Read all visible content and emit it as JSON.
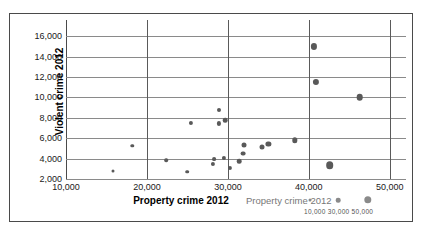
{
  "chart_data": {
    "type": "scatter",
    "title": "",
    "xlabel": "Property crime 2012",
    "ylabel": "Violent crime 2012",
    "xlim": [
      10000,
      52000
    ],
    "ylim": [
      2000,
      17000
    ],
    "xticks": [
      "10,000",
      "20,000",
      "30,000",
      "40,000",
      "50,000"
    ],
    "xtick_values": [
      10000,
      20000,
      30000,
      40000,
      50000
    ],
    "yticks": [
      "2,000",
      "4,000",
      "6,000",
      "8,000",
      "10,000",
      "12,000",
      "14,000",
      "16,000"
    ],
    "ytick_values": [
      2000,
      4000,
      6000,
      8000,
      10000,
      12000,
      14000,
      16000
    ],
    "grid": "both",
    "marker_color": "#595959",
    "size_encoding": "bubble area encodes property crime 2012",
    "points": [
      {
        "x": 15800,
        "y": 2800,
        "size": 3.0
      },
      {
        "x": 18200,
        "y": 5250,
        "size": 3.4
      },
      {
        "x": 22400,
        "y": 3850,
        "size": 3.6
      },
      {
        "x": 25000,
        "y": 2700,
        "size": 3.6
      },
      {
        "x": 25400,
        "y": 7500,
        "size": 4.2
      },
      {
        "x": 28100,
        "y": 3500,
        "size": 4.2
      },
      {
        "x": 28300,
        "y": 3950,
        "size": 3.8
      },
      {
        "x": 28900,
        "y": 8750,
        "size": 4.0
      },
      {
        "x": 28900,
        "y": 7450,
        "size": 4.2
      },
      {
        "x": 29500,
        "y": 4100,
        "size": 4.2
      },
      {
        "x": 29700,
        "y": 7750,
        "size": 4.6
      },
      {
        "x": 30200,
        "y": 3050,
        "size": 4.2
      },
      {
        "x": 31400,
        "y": 3750,
        "size": 4.6
      },
      {
        "x": 31900,
        "y": 4500,
        "size": 4.8
      },
      {
        "x": 32000,
        "y": 5300,
        "size": 5.0
      },
      {
        "x": 34200,
        "y": 5150,
        "size": 5.0
      },
      {
        "x": 35000,
        "y": 5450,
        "size": 5.2
      },
      {
        "x": 38300,
        "y": 5800,
        "size": 5.4
      },
      {
        "x": 40600,
        "y": 15000,
        "size": 6.2
      },
      {
        "x": 40900,
        "y": 11500,
        "size": 6.2
      },
      {
        "x": 42600,
        "y": 3350,
        "size": 7.6
      },
      {
        "x": 46300,
        "y": 10000,
        "size": 6.6
      }
    ]
  },
  "legend": {
    "title": "Property crime 2012",
    "size_labels": "10,000 30,000 50,000",
    "bubbles": [
      {
        "label": "10,000",
        "size": 3.0
      },
      {
        "label": "30,000",
        "size": 4.6
      },
      {
        "label": "50,000",
        "size": 7.4
      }
    ]
  }
}
